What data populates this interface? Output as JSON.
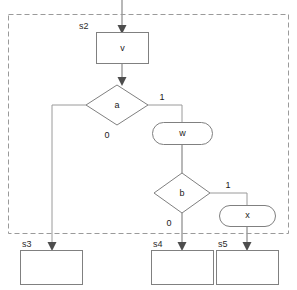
{
  "diagram": {
    "type": "flowchart",
    "title": "",
    "region": {
      "name": "dashed-boundary",
      "style": "dashed",
      "x": 8,
      "y": 14,
      "width": 280,
      "height": 219
    },
    "entry": {
      "name": "entry-arrow",
      "from_x": 122,
      "from_y": 0,
      "to_x": 122,
      "to_y": 33
    },
    "nodes": [
      {
        "id": "v",
        "label": "v",
        "shape": "rectangle",
        "state_label": "s2",
        "cx": 122,
        "cy": 48,
        "width": 52,
        "height": 31
      },
      {
        "id": "a",
        "label": "a",
        "shape": "diamond",
        "state_label": "",
        "cx": 117,
        "cy": 105,
        "width": 62,
        "height": 40
      },
      {
        "id": "w",
        "label": "w",
        "shape": "stadium",
        "state_label": "",
        "cx": 182,
        "cy": 133,
        "width": 60,
        "height": 23
      },
      {
        "id": "b",
        "label": "b",
        "shape": "diamond",
        "state_label": "",
        "cx": 182,
        "cy": 193,
        "width": 56,
        "height": 40
      },
      {
        "id": "x",
        "label": "x",
        "shape": "stadium",
        "state_label": "",
        "cx": 247,
        "cy": 216,
        "width": 56,
        "height": 21
      },
      {
        "id": "s3",
        "label": "",
        "shape": "rectangle",
        "state_label": "s3",
        "cx": 51,
        "cy": 267,
        "width": 62,
        "height": 34
      },
      {
        "id": "s4",
        "label": "",
        "shape": "rectangle",
        "state_label": "s4",
        "cx": 182,
        "cy": 267,
        "width": 62,
        "height": 34
      },
      {
        "id": "s5",
        "label": "",
        "shape": "rectangle",
        "state_label": "s5",
        "cx": 247,
        "cy": 267,
        "width": 62,
        "height": 34
      }
    ],
    "edges": [
      {
        "id": "e-entry-v",
        "from": "entry",
        "to": "v",
        "label": ""
      },
      {
        "id": "e-v-a",
        "from": "v",
        "to": "a",
        "label": ""
      },
      {
        "id": "e-a-s3",
        "from": "a",
        "to": "s3",
        "label": "0"
      },
      {
        "id": "e-a-w",
        "from": "a",
        "to": "w",
        "label": "1"
      },
      {
        "id": "e-w-b",
        "from": "w",
        "to": "b",
        "label": ""
      },
      {
        "id": "e-b-s4",
        "from": "b",
        "to": "s4",
        "label": "0"
      },
      {
        "id": "e-b-x",
        "from": "b",
        "to": "x",
        "label": "1"
      },
      {
        "id": "e-x-s5",
        "from": "x",
        "to": "s5",
        "label": ""
      }
    ],
    "labels": {
      "s2": "s2",
      "s3": "s3",
      "s4": "s4",
      "s5": "s5",
      "v": "v",
      "w": "w",
      "x": "x",
      "a": "a",
      "b": "b",
      "a_false": "0",
      "a_true": "1",
      "b_false": "0",
      "b_true": "1"
    },
    "colors": {
      "background": "#ffffff",
      "node_stroke": "#808080",
      "edge_stroke": "#9a9a9a",
      "region_stroke": "#9a9a9a",
      "text": "#1a1a1a",
      "arrowhead": "#4d4d4d"
    }
  }
}
